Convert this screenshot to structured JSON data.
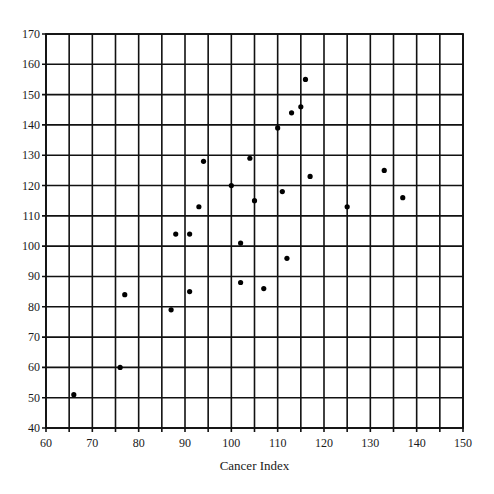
{
  "chart_data": {
    "type": "scatter",
    "title": "",
    "xlabel": "Cancer Index",
    "ylabel": "",
    "xlim": [
      60,
      150
    ],
    "ylim": [
      40,
      170
    ],
    "x_ticks": [
      60,
      70,
      80,
      90,
      100,
      110,
      120,
      130,
      140,
      150
    ],
    "y_ticks": [
      40,
      50,
      60,
      70,
      80,
      90,
      100,
      110,
      120,
      130,
      140,
      150,
      160,
      170
    ],
    "x_grid_step": 5,
    "y_grid_step": 10,
    "grid": true,
    "legend": null,
    "points": [
      {
        "x": 66,
        "y": 51
      },
      {
        "x": 76,
        "y": 60
      },
      {
        "x": 77,
        "y": 84
      },
      {
        "x": 87,
        "y": 79
      },
      {
        "x": 88,
        "y": 104
      },
      {
        "x": 91,
        "y": 104
      },
      {
        "x": 91,
        "y": 85
      },
      {
        "x": 93,
        "y": 113
      },
      {
        "x": 94,
        "y": 128
      },
      {
        "x": 100,
        "y": 120
      },
      {
        "x": 102,
        "y": 101
      },
      {
        "x": 102,
        "y": 88
      },
      {
        "x": 104,
        "y": 129
      },
      {
        "x": 105,
        "y": 115
      },
      {
        "x": 107,
        "y": 86
      },
      {
        "x": 110,
        "y": 139
      },
      {
        "x": 111,
        "y": 118
      },
      {
        "x": 112,
        "y": 96
      },
      {
        "x": 113,
        "y": 144
      },
      {
        "x": 115,
        "y": 146
      },
      {
        "x": 116,
        "y": 155
      },
      {
        "x": 117,
        "y": 123
      },
      {
        "x": 125,
        "y": 113
      },
      {
        "x": 133,
        "y": 125
      },
      {
        "x": 137,
        "y": 116
      }
    ]
  },
  "colors": {
    "grid": "#111111",
    "points": "#000000",
    "background": "#ffffff"
  }
}
